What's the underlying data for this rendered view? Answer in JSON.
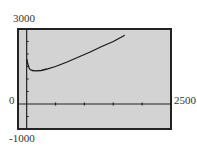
{
  "chart_data": {
    "type": "line",
    "title": "",
    "xlabel": "",
    "ylabel": "",
    "xlim": [
      -150,
      2500
    ],
    "ylim": [
      -1000,
      3000
    ],
    "grid": false,
    "x_tick_step": 500,
    "y_tick_step": 500,
    "window_labels": {
      "ymax": "3000",
      "ymin": "-1000",
      "xmin": "0",
      "xmax": "2500"
    },
    "series": [
      {
        "name": "y",
        "x": [
          5,
          20,
          40,
          60,
          100,
          150,
          250,
          350,
          500,
          700,
          900,
          1100,
          1300,
          1500,
          1700
        ],
        "y": [
          1800,
          1600,
          1450,
          1380,
          1340,
          1330,
          1340,
          1400,
          1500,
          1680,
          1880,
          2080,
          2300,
          2500,
          2750
        ]
      }
    ]
  },
  "colors": {
    "screen": "#d3d3d3",
    "frame": "#222222",
    "curve": "#1a1a1a"
  }
}
